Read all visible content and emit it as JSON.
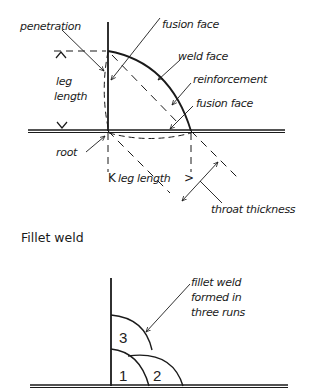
{
  "diagram": {
    "title": "Fillet weld",
    "colors": {
      "ink": "#1a1a1a",
      "background": "#ffffff"
    },
    "top_labels": {
      "penetration": "penetration",
      "fusion_face_top": "fusion face",
      "weld_face": "weld face",
      "reinforcement": "reinforcement",
      "fusion_face_bottom": "fusion face",
      "leg_length_line1": "leg",
      "leg_length_line2": "length",
      "root": "root",
      "leg_length_horizontal": "leg length",
      "throat_thickness": "throat thickness"
    },
    "bottom_labels": {
      "annotation_line1": "fillet weld",
      "annotation_line2": "formed in",
      "annotation_line3": "three runs",
      "run_1": "1",
      "run_2": "2",
      "run_3": "3"
    }
  }
}
